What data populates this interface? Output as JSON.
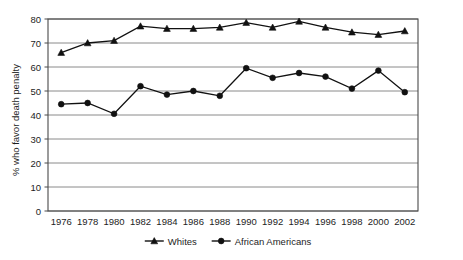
{
  "chart_data": {
    "type": "line",
    "title": "",
    "subtitle": "",
    "xlabel": "",
    "ylabel": "% who favor death penalty",
    "x": [
      1976,
      1978,
      1980,
      1982,
      1984,
      1986,
      1988,
      1990,
      1992,
      1994,
      1996,
      1998,
      2000,
      2002
    ],
    "categories": [
      "1976",
      "1978",
      "1980",
      "1982",
      "1984",
      "1986",
      "1988",
      "1990",
      "1992",
      "1994",
      "1996",
      "1998",
      "2000",
      "2002"
    ],
    "xlim": [
      1975,
      2003
    ],
    "ylim": [
      0,
      80
    ],
    "yticks": [
      0,
      10,
      20,
      30,
      40,
      50,
      60,
      70,
      80
    ],
    "ytick_labels": [
      "0",
      "10",
      "20",
      "30",
      "40",
      "50",
      "60",
      "70",
      "80"
    ],
    "grid": "horizontal",
    "legend_position": "bottom-center",
    "series": [
      {
        "name": "Whites",
        "marker": "triangle",
        "color": "#111111",
        "values": [
          66,
          70,
          71,
          77,
          76,
          76,
          76.5,
          78.5,
          76.5,
          79,
          76.5,
          74.5,
          73.5,
          75
        ]
      },
      {
        "name": "African Americans",
        "marker": "circle",
        "color": "#111111",
        "values": [
          44.5,
          45,
          40.5,
          52,
          48.5,
          50,
          48,
          59.5,
          55.5,
          57.5,
          56,
          51,
          58.5,
          49.5
        ]
      }
    ]
  },
  "legend": {
    "items": [
      {
        "label": "Whites",
        "marker": "triangle"
      },
      {
        "label": "African Americans",
        "marker": "circle"
      }
    ]
  },
  "colors": {
    "grid": "#8a8a8a",
    "frame": "#4a4a4a",
    "line": "#111111",
    "text": "#1d1d1d",
    "background": "#ffffff"
  }
}
